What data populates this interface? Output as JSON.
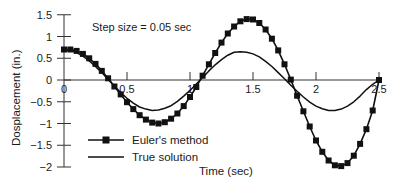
{
  "chart_data": {
    "type": "line",
    "title": "",
    "annotation": "Step size = 0.05 sec",
    "xlabel": "Time (sec)",
    "ylabel": "Dosplacement (in.)",
    "xlim": [
      0,
      2.5
    ],
    "ylim": [
      -2,
      1.5
    ],
    "xticks": [
      0,
      0.5,
      1,
      1.5,
      2,
      2.5
    ],
    "xtick_labels": [
      "0",
      "0.5",
      "1",
      "1.5",
      "2",
      "2.5"
    ],
    "yticks": [
      1.5,
      1,
      0.5,
      0,
      -0.5,
      -1,
      -1.5,
      -2
    ],
    "ytick_labels": [
      "1.5",
      "1",
      "0.5",
      "0",
      "−0.5",
      "−1",
      "−1.5",
      "−2"
    ],
    "grid": false,
    "legend_position": "lower left",
    "series": [
      {
        "name": "Euler's method",
        "marker": "square",
        "color": "#111111",
        "x": [
          0,
          0.05,
          0.1,
          0.15,
          0.2,
          0.25,
          0.3,
          0.35,
          0.4,
          0.45,
          0.5,
          0.55,
          0.6,
          0.65,
          0.7,
          0.75,
          0.8,
          0.85,
          0.9,
          0.95,
          1.0,
          1.05,
          1.1,
          1.15,
          1.2,
          1.25,
          1.3,
          1.35,
          1.4,
          1.45,
          1.5,
          1.55,
          1.6,
          1.65,
          1.7,
          1.75,
          1.8,
          1.85,
          1.9,
          1.95,
          2.0,
          2.05,
          2.1,
          2.15,
          2.2,
          2.25,
          2.3,
          2.35,
          2.4,
          2.45,
          2.5
        ],
        "values": [
          0.7,
          0.7,
          0.67,
          0.6,
          0.5,
          0.37,
          0.21,
          0.04,
          -0.15,
          -0.33,
          -0.51,
          -0.67,
          -0.81,
          -0.91,
          -0.98,
          -1.0,
          -0.97,
          -0.89,
          -0.77,
          -0.6,
          -0.39,
          -0.16,
          0.1,
          0.36,
          0.62,
          0.86,
          1.07,
          1.23,
          1.35,
          1.4,
          1.39,
          1.31,
          1.16,
          0.95,
          0.68,
          0.36,
          0.01,
          -0.36,
          -0.72,
          -1.07,
          -1.39,
          -1.65,
          -1.85,
          -1.96,
          -1.98,
          -1.91,
          -1.74,
          -1.47,
          -1.13,
          -0.7,
          0.0
        ]
      },
      {
        "name": "True solution",
        "marker": "none",
        "color": "#111111",
        "x": [
          0,
          0.05,
          0.1,
          0.15,
          0.2,
          0.25,
          0.3,
          0.35,
          0.4,
          0.45,
          0.5,
          0.55,
          0.6,
          0.65,
          0.7,
          0.75,
          0.8,
          0.85,
          0.9,
          0.95,
          1.0,
          1.05,
          1.1,
          1.15,
          1.2,
          1.25,
          1.3,
          1.35,
          1.4,
          1.45,
          1.5,
          1.55,
          1.6,
          1.65,
          1.7,
          1.75,
          1.8,
          1.85,
          1.9,
          1.95,
          2.0,
          2.05,
          2.1,
          2.15,
          2.2,
          2.25,
          2.3,
          2.35,
          2.4,
          2.45,
          2.5
        ],
        "values": [
          0.7,
          0.68,
          0.63,
          0.55,
          0.44,
          0.31,
          0.17,
          0.01,
          -0.14,
          -0.29,
          -0.42,
          -0.53,
          -0.62,
          -0.67,
          -0.7,
          -0.69,
          -0.65,
          -0.59,
          -0.49,
          -0.37,
          -0.24,
          -0.09,
          0.06,
          0.21,
          0.35,
          0.47,
          0.57,
          0.64,
          0.65,
          0.64,
          0.6,
          0.53,
          0.43,
          0.31,
          0.17,
          0.03,
          -0.12,
          -0.26,
          -0.39,
          -0.51,
          -0.6,
          -0.66,
          -0.7,
          -0.7,
          -0.67,
          -0.6,
          -0.5,
          -0.37,
          -0.22,
          -0.1,
          0.0
        ]
      }
    ]
  },
  "plot_area": {
    "x0_px": 64,
    "x_per_unit_px": 126,
    "y0_px": 80,
    "y_per_unit_px": 43.5,
    "axis_color": "#333333"
  },
  "labels": {
    "annotation": "Step size = 0.05 sec",
    "xlabel": "Time (sec)",
    "ylabel": "Dosplacement (in.)",
    "legend_euler": "Euler's method",
    "legend_true": "True solution"
  }
}
